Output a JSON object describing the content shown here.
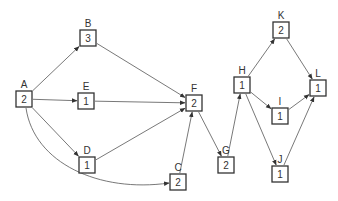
{
  "diagram": {
    "type": "activity-network",
    "colors": {
      "stroke": "#333333",
      "edge": "#555555",
      "background": "#ffffff"
    },
    "nodes": [
      {
        "id": "A",
        "label": "A",
        "value": "2",
        "x": 16,
        "y": 91
      },
      {
        "id": "B",
        "label": "B",
        "value": "3",
        "x": 80,
        "y": 30
      },
      {
        "id": "E",
        "label": "E",
        "value": "1",
        "x": 78,
        "y": 93
      },
      {
        "id": "D",
        "label": "D",
        "value": "1",
        "x": 79,
        "y": 157
      },
      {
        "id": "C",
        "label": "C",
        "value": "2",
        "x": 170,
        "y": 174
      },
      {
        "id": "F",
        "label": "F",
        "value": "2",
        "x": 186,
        "y": 95
      },
      {
        "id": "G",
        "label": "G",
        "value": "2",
        "x": 218,
        "y": 157
      },
      {
        "id": "H",
        "label": "H",
        "value": "1",
        "x": 234,
        "y": 77
      },
      {
        "id": "K",
        "label": "K",
        "value": "2",
        "x": 273,
        "y": 22
      },
      {
        "id": "I",
        "label": "I",
        "value": "1",
        "x": 272,
        "y": 108
      },
      {
        "id": "J",
        "label": "J",
        "value": "1",
        "x": 272,
        "y": 166
      },
      {
        "id": "L",
        "label": "L",
        "value": "1",
        "x": 310,
        "y": 80
      }
    ],
    "edges": [
      {
        "from": "A",
        "to": "B"
      },
      {
        "from": "A",
        "to": "E"
      },
      {
        "from": "A",
        "to": "D"
      },
      {
        "from": "A",
        "to": "C",
        "curved": true
      },
      {
        "from": "B",
        "to": "F"
      },
      {
        "from": "E",
        "to": "F"
      },
      {
        "from": "D",
        "to": "F"
      },
      {
        "from": "C",
        "to": "F"
      },
      {
        "from": "F",
        "to": "G"
      },
      {
        "from": "G",
        "to": "H"
      },
      {
        "from": "H",
        "to": "K"
      },
      {
        "from": "H",
        "to": "I"
      },
      {
        "from": "H",
        "to": "J"
      },
      {
        "from": "K",
        "to": "L"
      },
      {
        "from": "I",
        "to": "L"
      },
      {
        "from": "J",
        "to": "L"
      }
    ]
  }
}
